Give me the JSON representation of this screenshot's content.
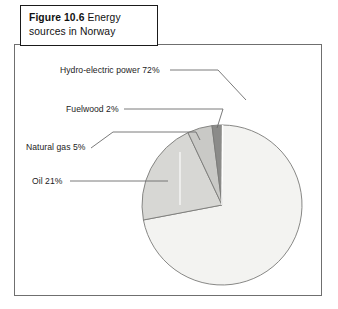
{
  "figure": {
    "caption_label": "Figure 10.6",
    "caption_text": "Energy sources in Norway"
  },
  "colors": {
    "frame_border": "#6f6f6f",
    "caption_border": "#1a1a1a",
    "leader_line": "#6b6b6b",
    "slice_outline": "#7a7a78",
    "hydro": "#f3f3f1",
    "oil": "#d7d7d4",
    "natural_gas": "#c9c9c6",
    "fuelwood": "#8b8b89",
    "text": "#1c1c1c"
  },
  "callouts": {
    "hydro": "Hydro-electric power 72%",
    "fuelwood": "Fuelwood 2%",
    "natural_gas": "Natural gas 5%",
    "oil": "Oil 21%"
  },
  "chart_data": {
    "type": "pie",
    "xlabel": "",
    "ylabel": "",
    "unit": "%",
    "start_angle_deg": 0,
    "direction": "clockwise",
    "legend": "none",
    "grid": false,
    "labels": [
      "Hydro-electric power",
      "Oil",
      "Natural gas",
      "Fuelwood"
    ],
    "values": [
      72,
      21,
      5,
      2
    ],
    "slices": [
      {
        "name": "Hydro-electric power",
        "value": 72,
        "label": "Hydro-electric power 72%",
        "color": "#f3f3f1",
        "start_deg": 0,
        "end_deg": 259.2
      },
      {
        "name": "Oil",
        "value": 21,
        "label": "Oil 21%",
        "color": "#d7d7d4",
        "start_deg": 259.2,
        "end_deg": 334.8
      },
      {
        "name": "Natural gas",
        "value": 5,
        "label": "Natural gas 5%",
        "color": "#c9c9c6",
        "start_deg": 334.8,
        "end_deg": 352.8
      },
      {
        "name": "Fuelwood",
        "value": 2,
        "label": "Fuelwood 2%",
        "color": "#8b8b89",
        "start_deg": 352.8,
        "end_deg": 360
      }
    ]
  }
}
